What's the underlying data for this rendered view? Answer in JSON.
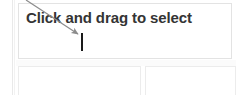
{
  "screen": {
    "width": 236,
    "height": 95,
    "background_color": "#ffffff"
  },
  "text_field": {
    "value": "Click and drag to select",
    "text_color": "#343434",
    "border_color": "#e3e3e3",
    "background_color": "#ffffff",
    "caret_visible": true,
    "caret_color": "#1a1a1a"
  },
  "annotation": {
    "arrow": {
      "name": "pointer-arrow",
      "color": "#8c8c8c",
      "from_x": 26,
      "from_y": 0,
      "to_x": 80,
      "to_y": 35
    }
  },
  "lower_boxes": [
    {
      "label": "",
      "border_color": "#ececec"
    },
    {
      "label": "",
      "border_color": "#ececec"
    }
  ],
  "gutter": {
    "line_color": "#e9e9e9"
  }
}
